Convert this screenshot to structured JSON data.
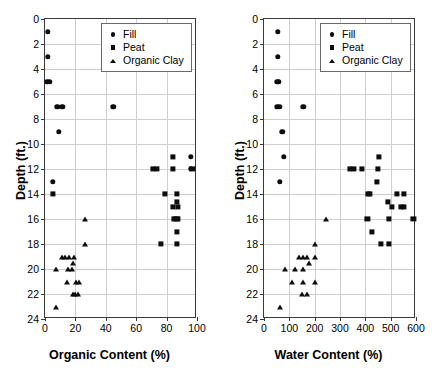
{
  "figure": {
    "background": "#ffffff",
    "marker_color": "#0d0d0d",
    "axis_color": "#3a3a3a",
    "grid_color": "#cfcfcf"
  },
  "legend": {
    "position": "top-right-inside",
    "entries": [
      {
        "label": "Fill",
        "marker": "circle"
      },
      {
        "label": "Peat",
        "marker": "square"
      },
      {
        "label": "Organic Clay",
        "marker": "triangle"
      }
    ]
  },
  "chart_data": [
    {
      "type": "scatter",
      "title": "",
      "xlabel": "Organic Content (%)",
      "ylabel": "Depth (ft.)",
      "xlim": [
        0,
        100
      ],
      "ylim": [
        0,
        24
      ],
      "y_inverted": true,
      "xticks": [
        0,
        20,
        40,
        60,
        80,
        100
      ],
      "yticks": [
        0,
        2,
        4,
        6,
        8,
        10,
        12,
        14,
        16,
        18,
        20,
        22,
        24
      ],
      "xticklabels": [
        "0",
        "20",
        "40",
        "60",
        "80",
        "100"
      ],
      "yticklabels": [
        "0",
        "2",
        "4",
        "6",
        "8",
        "10",
        "12",
        "14",
        "16",
        "18",
        "20",
        "22",
        "24"
      ],
      "grid": true,
      "legend_position": "upper right",
      "series": [
        {
          "name": "Fill",
          "marker": "circle",
          "points": [
            [
              2,
              1
            ],
            [
              2,
              3
            ],
            [
              1.6,
              5
            ],
            [
              3.2,
              5
            ],
            [
              8,
              7
            ],
            [
              11.5,
              7
            ],
            [
              45,
              7
            ],
            [
              9,
              9
            ],
            [
              5,
              13
            ],
            [
              96,
              11
            ],
            [
              96,
              12
            ]
          ]
        },
        {
          "name": "Peat",
          "marker": "square",
          "points": [
            [
              84,
              11
            ],
            [
              71,
              12
            ],
            [
              73.5,
              12
            ],
            [
              84,
              12
            ],
            [
              97,
              12
            ],
            [
              5,
              14
            ],
            [
              79,
              14
            ],
            [
              87,
              14
            ],
            [
              84,
              15
            ],
            [
              87.5,
              15
            ],
            [
              87,
              14.6
            ],
            [
              85,
              16
            ],
            [
              87.5,
              16
            ],
            [
              86.5,
              16
            ],
            [
              87,
              17
            ],
            [
              76,
              18
            ],
            [
              87,
              18
            ]
          ]
        },
        {
          "name": "Organic Clay",
          "marker": "triangle",
          "points": [
            [
              26.5,
              16
            ],
            [
              26,
              18
            ],
            [
              11,
              19
            ],
            [
              13,
              19
            ],
            [
              16,
              19
            ],
            [
              19,
              19
            ],
            [
              7.5,
              20
            ],
            [
              15,
              20
            ],
            [
              17.5,
              20
            ],
            [
              18.5,
              19.5
            ],
            [
              14.5,
              21
            ],
            [
              20.5,
              21
            ],
            [
              22.5,
              21
            ],
            [
              18.5,
              22
            ],
            [
              20,
              22
            ],
            [
              22,
              22
            ],
            [
              7.5,
              23
            ]
          ]
        }
      ]
    },
    {
      "type": "scatter",
      "title": "",
      "xlabel": "Water Content (%)",
      "ylabel": "Depth (ft.)",
      "xlim": [
        0,
        600
      ],
      "ylim": [
        0,
        24
      ],
      "y_inverted": true,
      "xticks": [
        0,
        100,
        200,
        300,
        400,
        500,
        600
      ],
      "yticks": [
        0,
        2,
        4,
        6,
        8,
        10,
        12,
        14,
        16,
        18,
        20,
        22,
        24
      ],
      "xticklabels": [
        "0",
        "100",
        "200",
        "300",
        "400",
        "500",
        "600"
      ],
      "yticklabels": [
        "0",
        "2",
        "4",
        "6",
        "8",
        "10",
        "12",
        "14",
        "16",
        "18",
        "20",
        "22",
        "24"
      ],
      "grid": true,
      "legend_position": "upper right",
      "series": [
        {
          "name": "Fill",
          "marker": "circle",
          "points": [
            [
              55,
              1
            ],
            [
              55,
              3
            ],
            [
              52,
              5
            ],
            [
              58,
              5
            ],
            [
              52,
              7
            ],
            [
              62,
              7
            ],
            [
              155,
              7
            ],
            [
              72,
              9
            ],
            [
              78,
              11
            ],
            [
              62,
              13
            ]
          ]
        },
        {
          "name": "Peat",
          "marker": "square",
          "points": [
            [
              455,
              11
            ],
            [
              340,
              12
            ],
            [
              356,
              12
            ],
            [
              385,
              12
            ],
            [
              450,
              12
            ],
            [
              447,
              13
            ],
            [
              410,
              14
            ],
            [
              418,
              14
            ],
            [
              524,
              14
            ],
            [
              553,
              14
            ],
            [
              488,
              14.6
            ],
            [
              505,
              15
            ],
            [
              540,
              15
            ],
            [
              553,
              15
            ],
            [
              408,
              16
            ],
            [
              492,
              16
            ],
            [
              590,
              16
            ],
            [
              425,
              17
            ],
            [
              462,
              18
            ],
            [
              492,
              18
            ]
          ]
        },
        {
          "name": "Organic Clay",
          "marker": "triangle",
          "points": [
            [
              245,
              16
            ],
            [
              200,
              18
            ],
            [
              137,
              19
            ],
            [
              152,
              19
            ],
            [
              168,
              19
            ],
            [
              200,
              19
            ],
            [
              178,
              19.5
            ],
            [
              83,
              20
            ],
            [
              123,
              20
            ],
            [
              153,
              20
            ],
            [
              110,
              21
            ],
            [
              152,
              21
            ],
            [
              200,
              21
            ],
            [
              150,
              22
            ],
            [
              170,
              22
            ],
            [
              65,
              23
            ]
          ]
        }
      ]
    }
  ]
}
